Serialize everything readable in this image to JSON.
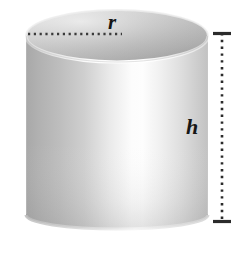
{
  "figure": {
    "name": "cylinder-diagram",
    "shape": "cylinder",
    "background_color": "#ffffff"
  },
  "labels": {
    "radius": "r",
    "height": "h"
  },
  "annotations": {
    "radius_line": {
      "name": "radius-dotted-line",
      "style": "dotted",
      "color": "#3a3a3a",
      "orientation": "horizontal"
    },
    "height_line": {
      "name": "height-dimension-line",
      "style": "dotted",
      "color": "#2b2b2b",
      "orientation": "vertical",
      "end_caps": "flat-ticks"
    }
  },
  "colors": {
    "top_face_light": "#e2e2e2",
    "top_face_dark": "#9a9a9a",
    "body_light": "#fdfdfd",
    "body_mid": "#d6d6d6",
    "body_dark": "#a6a6a6",
    "outline": "#c9c9c9",
    "label_text": "#161616"
  },
  "geometry": {
    "top_ellipse_cx": 117,
    "top_ellipse_cy": 36,
    "top_ellipse_rx": 91,
    "top_ellipse_ry": 26,
    "body_top_y": 36,
    "body_bottom_y": 215,
    "bottom_ellipse_ry": 14,
    "dimension_line_x": 222,
    "dimension_top_y": 33,
    "dimension_bottom_y": 222
  }
}
